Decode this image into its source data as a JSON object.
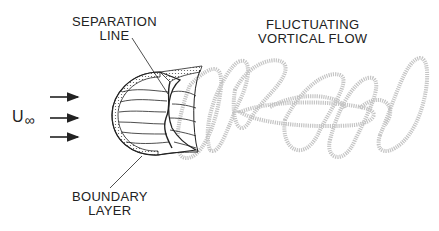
{
  "diagram": {
    "labels": {
      "separation_line": [
        "SEPARATION",
        "LINE"
      ],
      "boundary_layer": [
        "BOUNDARY",
        "LAYER"
      ],
      "fluctuating_flow": [
        "FLUCTUATING",
        "VORTICAL FLOW"
      ],
      "freestream_symbol": "U",
      "freestream_subscript": "∞"
    },
    "freestream_arrows": 3,
    "colors": {
      "ink": "#222222",
      "wake": "#bdbdbd",
      "background": "#ffffff"
    }
  }
}
